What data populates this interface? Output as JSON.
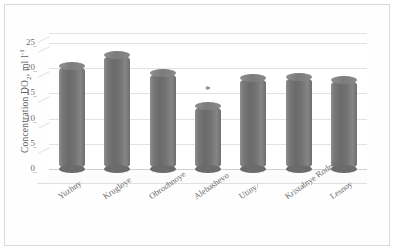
{
  "chart_data": {
    "type": "bar",
    "title": "",
    "subtitle": "",
    "xlabel": "",
    "ylabel": "Concentration DO2, ml l-1",
    "ylabel_parts": {
      "prefix": "Concentration DO",
      "sub": "2",
      "middle": ", ml l",
      "sup": "-1"
    },
    "categories": [
      "Yuzhny",
      "Krugloye",
      "Obrochnoye",
      "Alebashevo",
      "Utiny",
      "Kristalnye Rodniki",
      "Lesnoy"
    ],
    "values": [
      20.5,
      22.7,
      19.0,
      12.5,
      18.0,
      18.3,
      17.7
    ],
    "ylim": [
      0,
      27
    ],
    "yticks": [
      0,
      5,
      10,
      15,
      20,
      25
    ],
    "ytick_labels": [
      "0",
      "5",
      "10",
      "15",
      "20",
      "25"
    ],
    "grid": true,
    "legend": false,
    "legend_position": "none",
    "annotations": [
      {
        "category": "Alebashevo",
        "text": "*",
        "value": 15.8
      }
    ],
    "style": {
      "bar_color": "#6f6f6f",
      "bar_shape": "cylinder-3d",
      "grid_color": "#e2e2e2",
      "axis_color": "#cfcfcf",
      "text_color": "#6b6b6b",
      "background": "#ffffff",
      "border_color": "#d9d9d9"
    }
  }
}
